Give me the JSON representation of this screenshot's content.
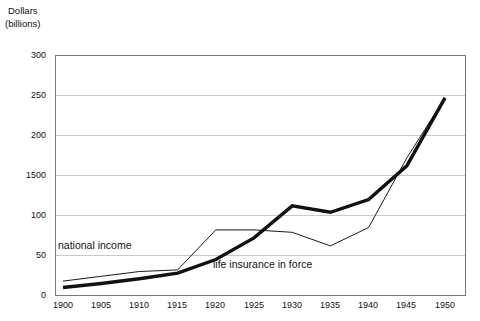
{
  "chart_data": {
    "type": "line",
    "title": "",
    "subtitle": "",
    "xlabel": "",
    "ylabel": "Dollars (billions)",
    "ylabel_lines": [
      "Dollars",
      "(billions)"
    ],
    "x": [
      1900,
      1905,
      1910,
      1915,
      1920,
      1925,
      1930,
      1935,
      1940,
      1945,
      1950
    ],
    "categories": [
      "1900",
      "1905",
      "1910",
      "1915",
      "1920",
      "1925",
      "1930",
      "1935",
      "1940",
      "1945",
      "1950"
    ],
    "xlim": [
      1900,
      1950
    ],
    "ylim": [
      0,
      300
    ],
    "ytick_values": [
      0,
      50,
      100,
      150,
      200,
      250,
      300
    ],
    "ytick_labels": [
      "0",
      "50",
      "100",
      "1500",
      "200",
      "250",
      "300"
    ],
    "grid": true,
    "grid_axis": "y",
    "legend": "inline-annotations",
    "series": [
      {
        "name": "national income",
        "style": "thin",
        "color": "#1a1a1a",
        "width": 1,
        "values": [
          18,
          24,
          30,
          32,
          82,
          82,
          79,
          62,
          85,
          172,
          247
        ]
      },
      {
        "name": "life insurance in force",
        "style": "thick",
        "color": "#111111",
        "width": 3.4,
        "values": [
          10,
          15,
          21,
          28,
          45,
          72,
          112,
          104,
          120,
          162,
          247
        ]
      }
    ],
    "annotations": [
      {
        "text": "national income",
        "x": 1901.5,
        "y": 57
      },
      {
        "text": "life insurance in force",
        "x": 1921,
        "y": 42
      }
    ]
  },
  "colors": {
    "background": "#ffffff",
    "frame": "#7a7a7a",
    "grid": "#c9c9c9",
    "axis_text": "#111111",
    "series_primary": "#1a1a1a"
  }
}
